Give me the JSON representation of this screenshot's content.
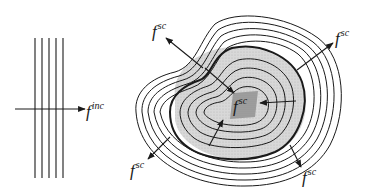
{
  "figure": {
    "colors": {
      "ink": "#1a1a1a",
      "shading": "#d4d4d4",
      "core": "#a8a8a8",
      "background": "#ffffff"
    },
    "incident": {
      "label_base": "f",
      "label_sup": "inc",
      "wavefront_count": 5
    },
    "scattered": {
      "label_base": "f",
      "label_sup": "sc",
      "labels": [
        {
          "id": "top-left",
          "base": "f",
          "sup": "sc"
        },
        {
          "id": "top-right",
          "base": "f",
          "sup": "sc"
        },
        {
          "id": "center",
          "base": "f",
          "sup": "sc"
        },
        {
          "id": "bottom-left",
          "base": "f",
          "sup": "sc"
        },
        {
          "id": "bottom-right",
          "base": "f",
          "sup": "sc"
        }
      ],
      "outer_contour_count": 5,
      "inner_contour_count": 4
    }
  }
}
